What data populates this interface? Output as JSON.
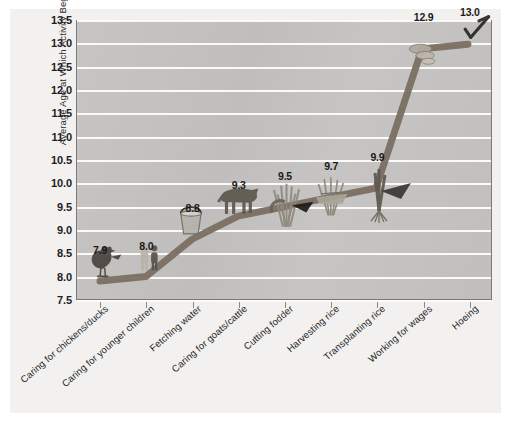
{
  "scan_artifact_text": "·  ·      ·    ·                                                                                    ·      ·",
  "chart_data": {
    "type": "line",
    "title": "",
    "xlabel": "",
    "ylabel": "Average Age at Which Activity Begins",
    "ylim": [
      7.5,
      13.5
    ],
    "ytick_step": 0.5,
    "ytick_labels": [
      "13.5",
      "13.0",
      "12.5",
      "12.0",
      "11.5",
      "11.0",
      "10.5",
      "10.0",
      "9.5",
      "9.0",
      "8.5",
      "8.0",
      "7.5"
    ],
    "grid": true,
    "legend": "none",
    "categories": [
      "Caring for chickens/ducks",
      "Caring for younger children",
      "Fetching water",
      "Caring for goats/cattle",
      "Cutting fodder",
      "Harvesting  rice",
      "Transplanting rice",
      "Working for wages",
      "Hoeing"
    ],
    "values": [
      7.9,
      8.0,
      8.8,
      9.3,
      9.5,
      9.7,
      9.9,
      12.9,
      13.0
    ],
    "value_labels": [
      "7.9",
      "8.0",
      "8.8",
      "9.3",
      "9.5",
      "9.7",
      "9.9",
      "12.9",
      "13.0"
    ],
    "point_icons": [
      "chicken-icon",
      "two-children-icon",
      "water-bucket-icon",
      "cow-icon",
      "fodder-sickle-icon",
      "rice-sheaf-icon",
      "rice-seedling-icon",
      "coins-wages-icon",
      "hoe-icon"
    ]
  },
  "colors": {
    "page_background": "#ffffff",
    "card_background": "#f2f1ef",
    "plot_background": "#c3c2c0",
    "gridline": "#fbfaf8",
    "series_line": "#7b6f63",
    "axis": "#7c7a78",
    "text": "#1d1d1d"
  }
}
